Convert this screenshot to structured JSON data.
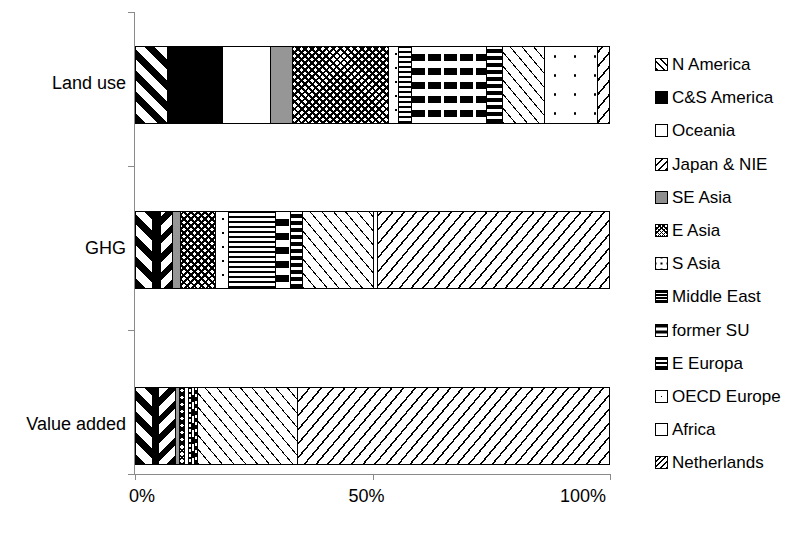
{
  "chart_data": {
    "type": "bar",
    "orientation": "horizontal",
    "stacked": true,
    "normalized": true,
    "title": "",
    "xlabel": "",
    "ylabel": "",
    "xlim": [
      0,
      100
    ],
    "grid": false,
    "legend_position": "right",
    "xtick_labels": [
      "0%",
      "50%",
      "100%"
    ],
    "xtick_values": [
      0,
      50,
      100
    ],
    "categories": [
      "Land use",
      "GHG",
      "Value added"
    ],
    "series": [
      {
        "name": "N America",
        "pattern": "diagonal-stripe-forward-wide",
        "values": [
          6.7,
          3.6,
          3.6
        ]
      },
      {
        "name": "C&S America",
        "pattern": "solid-black",
        "values": [
          11.6,
          1.7,
          1.3
        ]
      },
      {
        "name": "Oceania",
        "pattern": "solid-white",
        "values": [
          10.1,
          0.0,
          0.0
        ]
      },
      {
        "name": "Japan & NIE",
        "pattern": "diagonal-stripe-back",
        "values": [
          0.0,
          2.5,
          3.6
        ]
      },
      {
        "name": "SE Asia",
        "pattern": "solid-grey",
        "values": [
          4.6,
          1.7,
          0.8
        ]
      },
      {
        "name": "E Asia",
        "pattern": "cross-diamond-check",
        "values": [
          20.2,
          7.4,
          1.0
        ]
      },
      {
        "name": "S Asia",
        "pattern": "sparse-dots",
        "values": [
          2.1,
          2.7,
          0.8
        ]
      },
      {
        "name": "Middle East",
        "pattern": "horizontal-dense-lines",
        "values": [
          2.9,
          9.9,
          0.6
        ]
      },
      {
        "name": "former SU",
        "pattern": "vertical-dashed-lines",
        "values": [
          15.8,
          3.2,
          0.8
        ]
      },
      {
        "name": "E Europa",
        "pattern": "horizontal-heavy-bands",
        "values": [
          3.2,
          2.5,
          0.6
        ]
      },
      {
        "name": "OECD Europe",
        "pattern": "fine-forward-slashes",
        "values": [
          9.0,
          14.9,
          21.0
        ]
      },
      {
        "name": "Africa",
        "pattern": "very-sparse-dots",
        "values": [
          11.0,
          0.8,
          0.0
        ]
      },
      {
        "name": "Netherlands",
        "pattern": "back-slash-hatch",
        "values": [
          2.7,
          49.3,
          65.9
        ]
      }
    ]
  },
  "legend": {
    "items": [
      {
        "label": "N America"
      },
      {
        "label": "C&S America"
      },
      {
        "label": "Oceania"
      },
      {
        "label": "Japan & NIE"
      },
      {
        "label": "SE Asia"
      },
      {
        "label": "E Asia"
      },
      {
        "label": "S Asia"
      },
      {
        "label": "Middle East"
      },
      {
        "label": "former SU"
      },
      {
        "label": "E Europa"
      },
      {
        "label": "OECD Europe"
      },
      {
        "label": "Africa"
      },
      {
        "label": "Netherlands"
      }
    ]
  },
  "colors": {
    "ink": "#000000",
    "axis": "#8a8a8a",
    "grey_fill": "#969696",
    "background": "#ffffff"
  }
}
